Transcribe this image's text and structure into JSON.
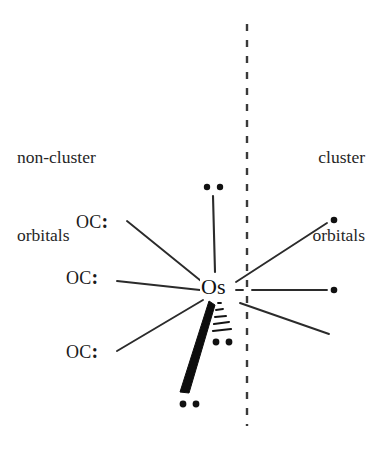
{
  "diagram": {
    "center_atom": "Os",
    "divider": {
      "name": "vertical-dashed-divider",
      "style": "dashed",
      "x": 247,
      "y_start": 24,
      "y_end": 426,
      "color": "#3a3a3a"
    },
    "regions": {
      "left": {
        "line1": "non-cluster",
        "line2": "orbitals"
      },
      "right": {
        "line1": "cluster",
        "line2": "orbitals"
      }
    },
    "ligands": [
      {
        "label": "OC",
        "lone_pair": ":",
        "x": 76,
        "y": 212,
        "bond": "upper-left-carbonyl-bond"
      },
      {
        "label": "OC",
        "lone_pair": ":",
        "x": 66,
        "y": 268,
        "bond": "middle-left-carbonyl-bond"
      },
      {
        "label": "OC",
        "lone_pair": ":",
        "x": 66,
        "y": 342,
        "bond": "lower-left-carbonyl-bond"
      }
    ],
    "non_cluster_orbitals": [
      {
        "name": "top-lone-pair-bond",
        "type": "plain-line",
        "electrons": 2,
        "direction": "up"
      },
      {
        "name": "bold-wedge-lone-pair-bond",
        "type": "bold-wedge",
        "electrons": 2,
        "direction": "down-left"
      },
      {
        "name": "hashed-wedge-lone-pair-bond",
        "type": "hashed-wedge",
        "electrons": 2,
        "direction": "down"
      }
    ],
    "cluster_orbitals": [
      {
        "name": "upper-right-cluster-orbital",
        "type": "plain-line",
        "electrons": 1,
        "direction": "up-right"
      },
      {
        "name": "right-cluster-orbital",
        "type": "plain-line",
        "electrons": 1,
        "direction": "right"
      },
      {
        "name": "lower-right-cluster-orbital",
        "type": "plain-line",
        "electrons": 0,
        "direction": "down-right"
      }
    ],
    "colors": {
      "background": "#ffffff",
      "ink": "#1a1a1a",
      "line": "#2b2b2b",
      "divider": "#3a3a3a"
    }
  }
}
